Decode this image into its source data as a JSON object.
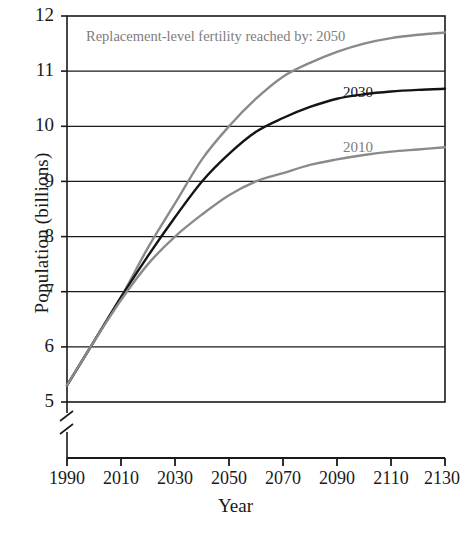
{
  "chart_data": {
    "type": "line",
    "title": "",
    "xlabel": "Year",
    "ylabel": "Population (billions)",
    "xlim": [
      1990,
      2130
    ],
    "ylim": [
      5,
      12
    ],
    "y_axis_break": true,
    "grid": "horizontal",
    "legend_position": "inline-labels",
    "xticks": [
      1990,
      2010,
      2030,
      2050,
      2070,
      2090,
      2110,
      2130
    ],
    "xtick_labels": [
      "1990",
      "2010",
      "2030",
      "2050",
      "2070",
      "2090",
      "2110",
      "2130"
    ],
    "yticks": [
      5,
      6,
      7,
      8,
      9,
      10,
      11,
      12
    ],
    "ytick_labels": [
      "5",
      "6",
      "7",
      "8",
      "9",
      "10",
      "11",
      "12"
    ],
    "annotations": [
      {
        "name": "replacement-note",
        "text": "Replacement-level fertility reached by: 2050",
        "color": "#7d7d7d"
      }
    ],
    "x": [
      1990,
      2000,
      2010,
      2020,
      2030,
      2040,
      2050,
      2060,
      2070,
      2080,
      2090,
      2100,
      2110,
      2120,
      2130
    ],
    "series": [
      {
        "name": "2050",
        "label": "2050",
        "color": "#8a8a8a",
        "values": [
          5.3,
          6.1,
          6.9,
          7.8,
          8.6,
          9.4,
          10.0,
          10.5,
          10.9,
          11.15,
          11.35,
          11.5,
          11.6,
          11.66,
          11.7
        ]
      },
      {
        "name": "2030",
        "label": "2030",
        "color": "#141414",
        "values": [
          5.3,
          6.1,
          6.9,
          7.65,
          8.35,
          9.0,
          9.5,
          9.9,
          10.15,
          10.35,
          10.5,
          10.58,
          10.63,
          10.66,
          10.68
        ]
      },
      {
        "name": "2010",
        "label": "2010",
        "color": "#8a8a8a",
        "values": [
          5.3,
          6.1,
          6.85,
          7.5,
          8.0,
          8.4,
          8.75,
          9.0,
          9.15,
          9.3,
          9.4,
          9.48,
          9.54,
          9.58,
          9.62
        ]
      }
    ]
  },
  "axis": {
    "ytitle": "Population (billions)",
    "xtitle": "Year"
  }
}
